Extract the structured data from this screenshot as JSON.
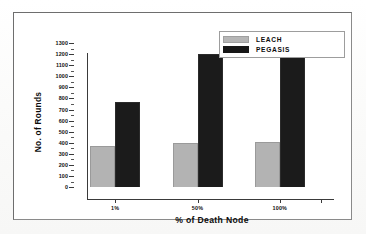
{
  "chart_data": {
    "type": "bar",
    "title": "",
    "categories": [
      "1%",
      "50%",
      "100%"
    ],
    "series": [
      {
        "name": "LEACH",
        "values": [
          370,
          400,
          410
        ],
        "color": "#b3b3b3"
      },
      {
        "name": "PEGASIS",
        "values": [
          770,
          1200,
          1250
        ],
        "color": "#1b1b1b"
      }
    ],
    "xlabel": "% of Death Node",
    "ylabel": "No. of Rounds",
    "ylim": [
      0,
      1300
    ],
    "ytick_step": 100,
    "yticks": [
      0,
      100,
      200,
      300,
      400,
      500,
      600,
      700,
      800,
      900,
      1000,
      1100,
      1200,
      1300
    ],
    "ytick_labels": [
      "0",
      "100",
      "200",
      "300",
      "400",
      "500",
      "600",
      "700",
      "800",
      "900",
      "1000",
      "1100",
      "1200",
      "1300"
    ],
    "grid": false,
    "legend_position": "top-right"
  },
  "legend": {
    "entries": [
      {
        "label": "LEACH",
        "swatch": "gray-swatch"
      },
      {
        "label": "PEGASIS",
        "swatch": "black-swatch"
      }
    ]
  },
  "axes": {
    "x_title": "% of Death Node",
    "y_title": "No. of Rounds"
  },
  "colors": {
    "leach": "#b3b3b3",
    "pegasis": "#1b1b1b",
    "axis": "#3a3a3a",
    "frame": "#6e6e6e",
    "background": "#ffffff"
  }
}
